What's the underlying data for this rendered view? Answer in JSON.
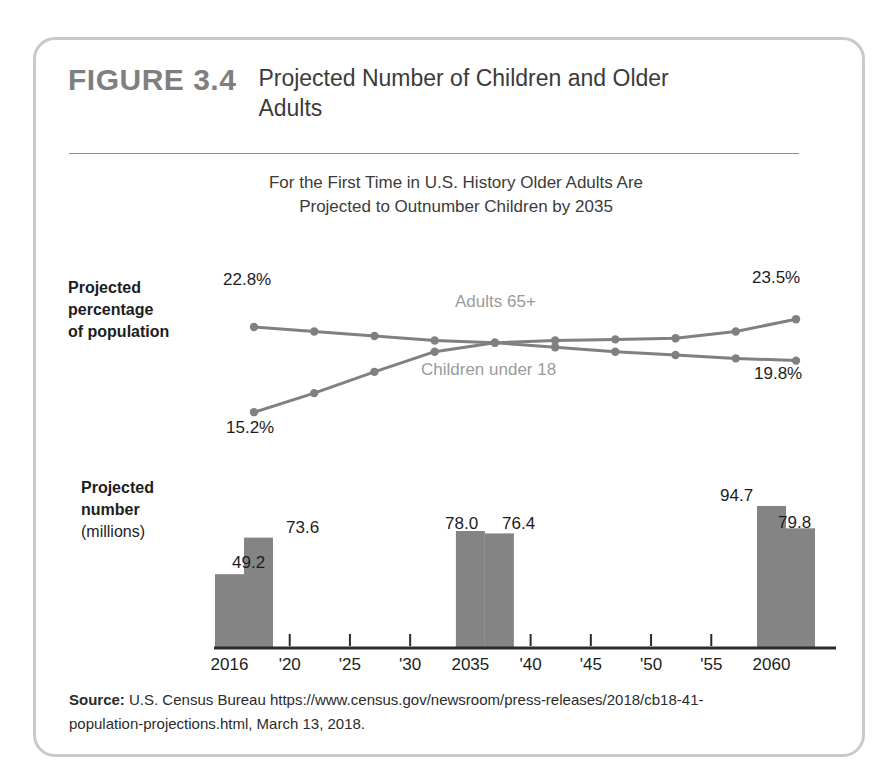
{
  "figure": {
    "number": "FIGURE 3.4",
    "title": "Projected Number of Children and Older Adults",
    "subtitle_line1": "For the First Time in U.S. History Older Adults Are",
    "subtitle_line2": "Projected to Outnumber Children by 2035",
    "source_label": "Source:",
    "source_text": " U.S. Census Bureau https://www.census.gov/newsroom/press-releases/2018/cb18-41-population-projections.html, March 13, 2018."
  },
  "labels": {
    "percent_axis_line1": "Projected",
    "percent_axis_line2": "percentage",
    "percent_axis_line3": "of population",
    "number_axis_line1": "Projected",
    "number_axis_line2": "number",
    "number_axis_line3": "(millions)"
  },
  "colors": {
    "line": "#808080",
    "marker": "#808080",
    "bar": "#848484",
    "series_text": "#9b9b9b",
    "border": "#c9c9c9",
    "figure_number": "#7f7f7f"
  },
  "chart_data": [
    {
      "type": "line",
      "title": "Projected percentage of population",
      "ylabel": "Projected percentage of population",
      "xlabel": "",
      "grid": false,
      "legend_position": "inline",
      "categories": [
        "2016",
        "'20",
        "'25",
        "'30",
        "2035",
        "'40",
        "'45",
        "'50",
        "'55",
        "2060"
      ],
      "x": [
        2016,
        2020,
        2025,
        2030,
        2035,
        2040,
        2045,
        2050,
        2055,
        2060
      ],
      "ylim": [
        14.5,
        24.5
      ],
      "series": [
        {
          "name": "Children under 18",
          "values": [
            22.8,
            22.4,
            22.0,
            21.6,
            21.4,
            21.0,
            20.6,
            20.3,
            20.0,
            19.8
          ],
          "endpoint_labels": {
            "start": "22.8%",
            "end": "19.8%"
          }
        },
        {
          "name": "Adults 65+",
          "values": [
            15.2,
            16.9,
            18.8,
            20.6,
            21.4,
            21.6,
            21.7,
            21.8,
            22.4,
            23.5
          ],
          "endpoint_labels": {
            "start": "15.2%",
            "end": "23.5%"
          }
        }
      ],
      "annotations": [
        {
          "text": "Adults 65+",
          "x": 2032
        },
        {
          "text": "Children under 18",
          "x": 2032
        }
      ]
    },
    {
      "type": "bar",
      "title": "Projected number (millions)",
      "ylabel": "Projected number (millions)",
      "xlabel": "",
      "grid": false,
      "categories": [
        "2016",
        "'20",
        "'25",
        "'30",
        "2035",
        "'40",
        "'45",
        "'50",
        "'55",
        "2060"
      ],
      "ylim": [
        0,
        100
      ],
      "series": [
        {
          "name": "Children under 18",
          "values": [
            73.6,
            null,
            null,
            null,
            76.4,
            null,
            null,
            null,
            null,
            79.8
          ]
        },
        {
          "name": "Adults 65+",
          "values": [
            49.2,
            null,
            null,
            null,
            78.0,
            null,
            null,
            null,
            null,
            94.7
          ]
        }
      ],
      "bar_groups": [
        {
          "category": "2016",
          "left_value": 49.2,
          "left_label": "49.2",
          "right_value": 73.6,
          "right_label": "73.6"
        },
        {
          "category": "2035",
          "left_value": 78.0,
          "left_label": "78.0",
          "right_value": 76.4,
          "right_label": "76.4"
        },
        {
          "category": "2060",
          "left_value": 94.7,
          "left_label": "94.7",
          "right_value": 79.8,
          "right_label": "79.8"
        }
      ]
    }
  ],
  "axis_ticks": [
    "2016",
    "'20",
    "'25",
    "'30",
    "2035",
    "'40",
    "'45",
    "'50",
    "'55",
    "2060"
  ],
  "line_labels": {
    "start_children": "22.8%",
    "end_children": "19.8%",
    "start_adults": "15.2%",
    "end_adults": "23.5%",
    "series_adults": "Adults 65+",
    "series_children": "Children under 18"
  },
  "bar_labels": {
    "b2016_left": "49.2",
    "b2016_right": "73.6",
    "b2035_left": "78.0",
    "b2035_right": "76.4",
    "b2060_left": "94.7",
    "b2060_right": "79.8"
  }
}
